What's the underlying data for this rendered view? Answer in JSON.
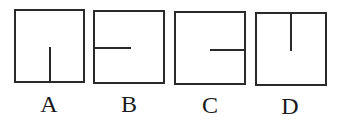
{
  "figure": {
    "options": [
      {
        "label": "A",
        "line": "vertical segment from middle of bottom edge up to center"
      },
      {
        "label": "B",
        "line": "horizontal segment from middle of left edge to center"
      },
      {
        "label": "C",
        "line": "horizontal segment from middle of right edge to center"
      },
      {
        "label": "D",
        "line": "vertical segment from middle of top edge down to center"
      }
    ],
    "colors": {
      "stroke": "#2a2a2a",
      "background": "#ffffff"
    }
  }
}
